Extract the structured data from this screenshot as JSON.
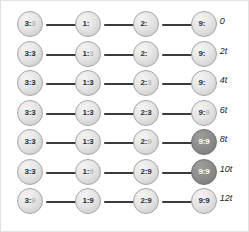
{
  "figure": {
    "node_count_per_row": 4,
    "row_count": 7,
    "colors": {
      "node_light": "#e4e4e4",
      "node_dark": "#8d8d8d",
      "node_border": "#9a9a9a",
      "link": "#3b3b3b",
      "text_dark": "#2f2f2f",
      "text_light": "#ffffff",
      "background": "#ffffff",
      "frame": "#e2e2e2"
    }
  },
  "rows": [
    {
      "tau_symbol": "τ = ",
      "tau_value": "0",
      "nodes": [
        {
          "prefix": "3:",
          "suffix": "3",
          "suffix_opacity": "mid",
          "shade": "light"
        },
        {
          "prefix": "1:",
          "suffix": "3",
          "suffix_opacity": "none",
          "shade": "light"
        },
        {
          "prefix": "2:",
          "suffix": "3",
          "suffix_opacity": "none",
          "shade": "light"
        },
        {
          "prefix": "9:",
          "suffix": "9",
          "suffix_opacity": "none",
          "shade": "light"
        }
      ]
    },
    {
      "tau_symbol": "τ = ",
      "tau_value": "2t",
      "nodes": [
        {
          "prefix": "3:",
          "suffix": "3",
          "suffix_opacity": "full",
          "shade": "light"
        },
        {
          "prefix": "1:",
          "suffix": "3",
          "suffix_opacity": "mid",
          "shade": "light"
        },
        {
          "prefix": "2:",
          "suffix": "3",
          "suffix_opacity": "none",
          "shade": "light"
        },
        {
          "prefix": "9:",
          "suffix": "9",
          "suffix_opacity": "none",
          "shade": "light"
        }
      ]
    },
    {
      "tau_symbol": "τ = ",
      "tau_value": "4t",
      "nodes": [
        {
          "prefix": "3:",
          "suffix": "3",
          "suffix_opacity": "full",
          "shade": "light"
        },
        {
          "prefix": "1:",
          "suffix": "3",
          "suffix_opacity": "full",
          "shade": "light"
        },
        {
          "prefix": "2:",
          "suffix": "3",
          "suffix_opacity": "mid",
          "shade": "light"
        },
        {
          "prefix": "9:",
          "suffix": "9",
          "suffix_opacity": "none",
          "shade": "light"
        }
      ]
    },
    {
      "tau_symbol": "τ = ",
      "tau_value": "6t",
      "nodes": [
        {
          "prefix": "3:",
          "suffix": "3",
          "suffix_opacity": "full",
          "shade": "light"
        },
        {
          "prefix": "1:",
          "suffix": "3",
          "suffix_opacity": "full",
          "shade": "light"
        },
        {
          "prefix": "2:",
          "suffix": "3",
          "suffix_opacity": "full",
          "shade": "light"
        },
        {
          "prefix": "9:",
          "suffix": "9",
          "suffix_opacity": "mid",
          "shade": "light"
        }
      ]
    },
    {
      "tau_symbol": "τ = ",
      "tau_value": "8t",
      "nodes": [
        {
          "prefix": "3:",
          "suffix": "3",
          "suffix_opacity": "full",
          "shade": "light"
        },
        {
          "prefix": "1:",
          "suffix": "3",
          "suffix_opacity": "full",
          "shade": "light"
        },
        {
          "prefix": "2:",
          "suffix": "9",
          "suffix_opacity": "mid",
          "shade": "light"
        },
        {
          "prefix": "9:",
          "suffix": "9",
          "suffix_opacity": "full",
          "shade": "dark"
        }
      ]
    },
    {
      "tau_symbol": "τ = ",
      "tau_value": "10t",
      "nodes": [
        {
          "prefix": "3:",
          "suffix": "3",
          "suffix_opacity": "full",
          "shade": "light"
        },
        {
          "prefix": "1:",
          "suffix": "9",
          "suffix_opacity": "mid",
          "shade": "light"
        },
        {
          "prefix": "2:",
          "suffix": "9",
          "suffix_opacity": "full",
          "shade": "light"
        },
        {
          "prefix": "9:",
          "suffix": "9",
          "suffix_opacity": "full",
          "shade": "dark"
        }
      ]
    },
    {
      "tau_symbol": "τ = ",
      "tau_value": "12t",
      "nodes": [
        {
          "prefix": "3:",
          "suffix": "9",
          "suffix_opacity": "mid",
          "shade": "light"
        },
        {
          "prefix": "1:",
          "suffix": "9",
          "suffix_opacity": "full",
          "shade": "light"
        },
        {
          "prefix": "2:",
          "suffix": "9",
          "suffix_opacity": "full",
          "shade": "light"
        },
        {
          "prefix": "9:",
          "suffix": "9",
          "suffix_opacity": "full",
          "shade": "light"
        }
      ]
    }
  ]
}
